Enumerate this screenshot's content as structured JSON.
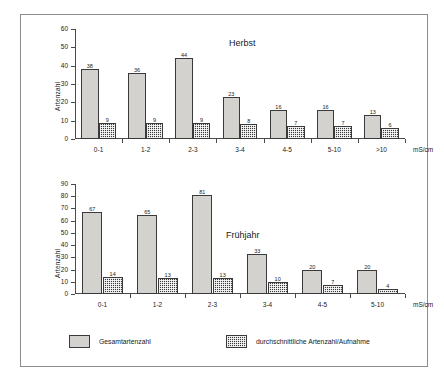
{
  "figure": {
    "series_labels": {
      "total": "Gesamtartenzahl",
      "average": "durchschnittliche Artenzahl/Aufnahme"
    },
    "colors": {
      "total": "#d4d2cf",
      "average": "#3b3b3b",
      "axis": "#4a4a4a",
      "frame": "#8c8c8c",
      "text": "#1a1a1a"
    }
  },
  "chart_data": [
    {
      "type": "bar",
      "title": "Herbst",
      "xlabel": "mS/cm",
      "ylabel": "Artenzahl",
      "ylim": [
        0,
        60
      ],
      "yticks": [
        0,
        10,
        20,
        30,
        40,
        50,
        60
      ],
      "grid": false,
      "legend_position": "bottom",
      "categories": [
        "0-1",
        "1-2",
        "2-3",
        "3-4",
        "4-5",
        "5-10",
        ">10"
      ],
      "series": [
        {
          "name": "Gesamtartenzahl",
          "values": [
            38,
            36,
            44,
            23,
            16,
            16,
            13
          ]
        },
        {
          "name": "durchschnittliche Artenzahl/Aufnahme",
          "values": [
            9,
            9,
            9,
            8,
            7,
            7,
            6
          ]
        }
      ]
    },
    {
      "type": "bar",
      "title": "Frühjahr",
      "xlabel": "mS/cm",
      "ylabel": "Artenzahl",
      "ylim": [
        0,
        90
      ],
      "yticks": [
        0,
        10,
        20,
        30,
        40,
        50,
        60,
        70,
        80,
        90
      ],
      "grid": false,
      "legend_position": "bottom",
      "categories": [
        "0-1",
        "1-2",
        "2-3",
        "3-4",
        "4-5",
        "5-10"
      ],
      "series": [
        {
          "name": "Gesamtartenzahl",
          "values": [
            67,
            65,
            81,
            33,
            20,
            20
          ]
        },
        {
          "name": "durchschnittliche Artenzahl/Aufnahme",
          "values": [
            14,
            13,
            13,
            10,
            7,
            4
          ]
        }
      ]
    }
  ]
}
